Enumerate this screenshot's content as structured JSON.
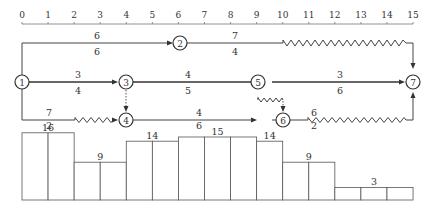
{
  "diagram": {
    "type": "time-scaled double-code network with resource histogram",
    "time_axis": {
      "ticks": [
        "0",
        "1",
        "2",
        "3",
        "4",
        "5",
        "6",
        "7",
        "8",
        "9",
        "10",
        "11",
        "12",
        "13",
        "14",
        "15"
      ],
      "x0": 22,
      "px_per_day": 26.07
    },
    "nodes": [
      {
        "id": "1",
        "label": "1",
        "day": 0,
        "row": "mid"
      },
      {
        "id": "2",
        "label": "2",
        "day": 6,
        "row": "top"
      },
      {
        "id": "3",
        "label": "3",
        "day": 4,
        "row": "mid"
      },
      {
        "id": "4",
        "label": "4",
        "day": 4,
        "row": "bot"
      },
      {
        "id": "5",
        "label": "5",
        "day": 9,
        "row": "mid"
      },
      {
        "id": "6",
        "label": "6",
        "day": 9,
        "row": "bot"
      },
      {
        "id": "7",
        "label": "7",
        "day": 15,
        "row": "mid"
      }
    ],
    "activities": [
      {
        "from": "1",
        "to": "2",
        "top_label": "6",
        "bottom_label": "6"
      },
      {
        "from": "2",
        "to": "7",
        "top_label": "7",
        "bottom_label": "4",
        "free_float_days": "10-15"
      },
      {
        "from": "1",
        "to": "3",
        "top_label": "3",
        "bottom_label": "4",
        "critical": true
      },
      {
        "from": "3",
        "to": "5",
        "top_label": "4",
        "bottom_label": "5",
        "critical": true
      },
      {
        "from": "5",
        "to": "7",
        "top_label": "3",
        "bottom_label": "6",
        "critical": true
      },
      {
        "from": "1",
        "to": "4",
        "top_label": "7",
        "bottom_label": "2",
        "free_float_days": "2-4"
      },
      {
        "from": "4",
        "to": "6",
        "top_label": "4",
        "bottom_label": "6"
      },
      {
        "from": "6",
        "to": "7",
        "top_label": "6",
        "bottom_label": "2",
        "free_float_days": "11-15"
      },
      {
        "from": "3",
        "to": "4",
        "dummy": true
      },
      {
        "from": "5",
        "to": "6",
        "dummy": true,
        "free_float_days": "9-10"
      }
    ],
    "histogram": {
      "segments": [
        {
          "start": 0,
          "end": 2,
          "value": "16"
        },
        {
          "start": 2,
          "end": 4,
          "value": "9"
        },
        {
          "start": 4,
          "end": 6,
          "value": "14"
        },
        {
          "start": 6,
          "end": 9,
          "value": "15"
        },
        {
          "start": 9,
          "end": 10,
          "value": "14"
        },
        {
          "start": 10,
          "end": 12,
          "value": "9"
        },
        {
          "start": 12,
          "end": 15,
          "value": "3"
        }
      ]
    }
  }
}
